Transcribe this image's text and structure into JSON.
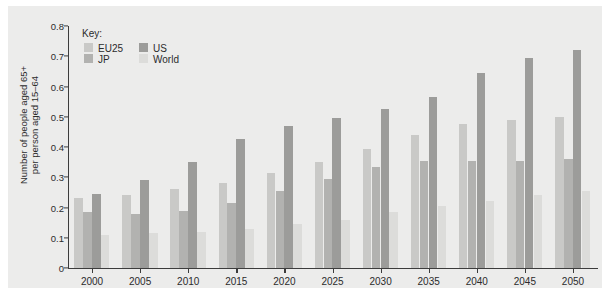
{
  "chart_data": {
    "type": "bar",
    "title": "",
    "xlabel": "",
    "ylabel": "Number of people aged 65+\nper person aged 15–64",
    "ylim": [
      0,
      0.8
    ],
    "ytick_labels": [
      "0",
      "0.1",
      "0.2",
      "0.3",
      "0.4",
      "0.5",
      "0.6",
      "0.7",
      "0.8"
    ],
    "ytick_values": [
      0,
      0.1,
      0.2,
      0.3,
      0.4,
      0.5,
      0.6,
      0.7,
      0.8
    ],
    "grid": false,
    "legend_position": "top-left",
    "legend_title": "Key:",
    "categories": [
      "2000",
      "2005",
      "2010",
      "2015",
      "2020",
      "2025",
      "2030",
      "2035",
      "2040",
      "2045",
      "2050"
    ],
    "series": [
      {
        "name": "EU25",
        "color": "#c9c9c7",
        "values": [
          0.23,
          0.24,
          0.26,
          0.28,
          0.315,
          0.35,
          0.395,
          0.44,
          0.475,
          0.49,
          0.5
        ]
      },
      {
        "name": "JP",
        "color": "#b2b2b0",
        "values": [
          0.185,
          0.18,
          0.19,
          0.215,
          0.255,
          0.295,
          0.335,
          0.355,
          0.355,
          0.355,
          0.36
        ]
      },
      {
        "name": "US",
        "color": "#9c9c9a",
        "values": [
          0.245,
          0.29,
          0.35,
          0.425,
          0.47,
          0.495,
          0.525,
          0.565,
          0.645,
          0.695,
          0.72
        ]
      },
      {
        "name": "World",
        "color": "#dcdcda",
        "values": [
          0.11,
          0.115,
          0.12,
          0.13,
          0.145,
          0.16,
          0.185,
          0.205,
          0.22,
          0.24,
          0.255
        ]
      }
    ]
  },
  "colors": {
    "page_background": "#ffffff",
    "panel_background": "#ececeb",
    "axis": "#3c3c3c",
    "text": "#2b2b2b"
  }
}
